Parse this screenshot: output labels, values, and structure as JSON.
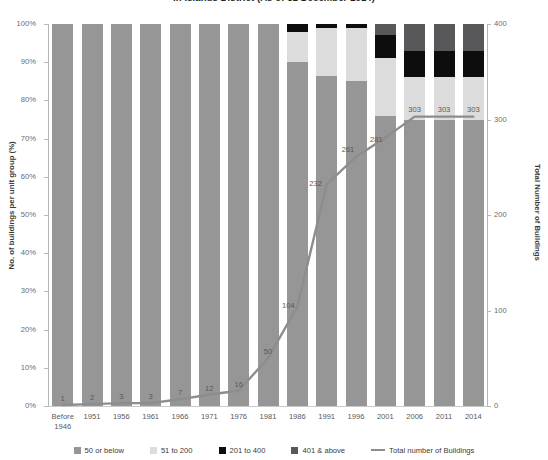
{
  "chart": {
    "title": "in Islands District (As of 31 December 2014)"
  },
  "axes": {
    "left_title": "No. of buildings per unit group (%)",
    "right_title": "Total Number of Buildings",
    "left_ticks": [
      "0%",
      "10%",
      "20%",
      "30%",
      "40%",
      "50%",
      "60%",
      "70%",
      "80%",
      "90%",
      "100%"
    ],
    "right_ticks": [
      "0",
      "100",
      "200",
      "300",
      "400"
    ]
  },
  "legend": {
    "items": [
      {
        "label": "50 or below",
        "color": "#969696"
      },
      {
        "label": "51 to 200",
        "color": "#dcdcdc"
      },
      {
        "label": "201 to 400",
        "color": "#0d0d0d"
      },
      {
        "label": "401 & above",
        "color": "#58585a"
      },
      {
        "label": "Total number of Buildings",
        "color": "#8d8d8d"
      }
    ]
  },
  "chart_data": {
    "type": "bar",
    "subtype": "stacked-bar-with-line (combo, 100% stacked bars + secondary-axis line)",
    "title": "in Islands District (As of 31 December 2014)",
    "xlabel": "",
    "ylabel": "No. of buildings per unit group (%)",
    "y2label": "Total Number of Buildings",
    "ylim": [
      0,
      100
    ],
    "y2lim": [
      0,
      400
    ],
    "grid": false,
    "legend_position": "bottom",
    "categories": [
      "Before 1946",
      "1951",
      "1956",
      "1961",
      "1966",
      "1971",
      "1976",
      "1981",
      "1986",
      "1991",
      "1996",
      "2001",
      "2006",
      "2011",
      "2014"
    ],
    "series": [
      {
        "name": "50 or below",
        "color": "#969696",
        "values": [
          100,
          100,
          100,
          100,
          100,
          100,
          100,
          100,
          90,
          86.5,
          85,
          76,
          75,
          75,
          75
        ]
      },
      {
        "name": "51 to 200",
        "color": "#dcdcdc",
        "values": [
          0,
          0,
          0,
          0,
          0,
          0,
          0,
          0,
          8,
          12.5,
          14,
          15,
          11,
          11,
          11
        ]
      },
      {
        "name": "201 to 400",
        "color": "#0d0d0d",
        "values": [
          0,
          0,
          0,
          0,
          0,
          0,
          0,
          0,
          2,
          1,
          1,
          6,
          7,
          7,
          7
        ]
      },
      {
        "name": "401 & above",
        "color": "#58585a",
        "values": [
          0,
          0,
          0,
          0,
          0,
          0,
          0,
          0,
          0,
          0,
          0,
          3,
          7,
          7,
          7
        ]
      }
    ],
    "line_series": {
      "name": "Total number of Buildings",
      "color": "#8d8d8d",
      "axis": "y2",
      "values": [
        1,
        2,
        3,
        3,
        7,
        12,
        16,
        50,
        104,
        232,
        261,
        281,
        303,
        303,
        303
      ],
      "data_labels": [
        "1",
        "2",
        "3",
        "3",
        "7",
        "12",
        "16",
        "50",
        "104",
        "232",
        "261",
        "281",
        "303",
        "303",
        "303"
      ]
    }
  }
}
